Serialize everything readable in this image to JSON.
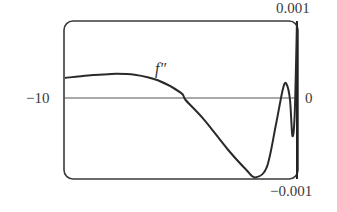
{
  "chart_data": {
    "type": "line",
    "title": "",
    "series": [
      {
        "name": "f''",
        "points": [
          [
            -10,
            0.00028
          ],
          [
            -9,
            0.00031
          ],
          [
            -8,
            0.00033
          ],
          [
            -7,
            0.00032
          ],
          [
            -6,
            0.00025
          ],
          [
            -5,
            9e-05
          ],
          [
            -4.8,
            0.0
          ],
          [
            -4,
            -0.00025
          ],
          [
            -3,
            -0.00062
          ],
          [
            -2.2,
            -0.00088
          ],
          [
            -1.8,
            -0.00098
          ],
          [
            -1.3,
            -0.00085
          ],
          [
            -0.9,
            -0.0003
          ],
          [
            -0.6,
            0.00015
          ],
          [
            -0.45,
            0.0002
          ],
          [
            -0.3,
            0.0
          ],
          [
            -0.2,
            -0.00045
          ],
          [
            -0.1,
            -0.00018
          ],
          [
            0,
            0.001
          ]
        ]
      }
    ],
    "xlim": [
      -10,
      0
    ],
    "ylim": [
      -0.001,
      0.001
    ],
    "xlabel": "",
    "ylabel": "",
    "tick_labels": {
      "x_left": "−10",
      "x_right": "0",
      "y_top": "0.001",
      "y_bottom": "−0.001"
    },
    "annotations": [
      "f″"
    ],
    "grid": false,
    "legend": "none"
  },
  "labels": {
    "x_min": "−10",
    "x_max": "0",
    "y_max": "0.001",
    "y_min": "−0.001",
    "curve": "f″"
  },
  "colors": {
    "frame": "#3a3a3a",
    "axis": "#555555",
    "curve": "#2a2a2a"
  }
}
